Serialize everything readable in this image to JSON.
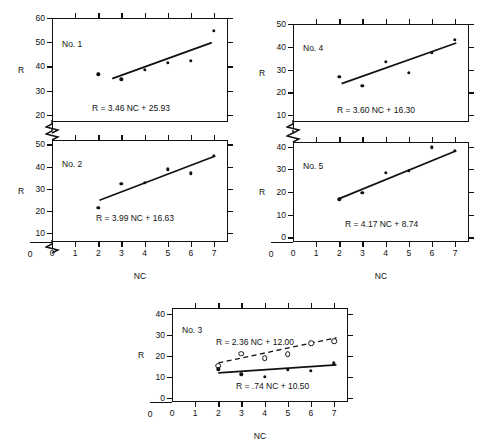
{
  "figure": {
    "axis_title_y": "R",
    "axis_title_x": "NC"
  },
  "chart_data": [
    {
      "type": "scatter",
      "title": "No. 1",
      "xlabel": "NC",
      "ylabel": "R",
      "xlim": [
        0,
        7.6
      ],
      "ylim": [
        17,
        60
      ],
      "xticks": [
        0,
        1,
        2,
        3,
        4,
        5,
        6,
        7
      ],
      "yticks": [
        20,
        30,
        40,
        50,
        60
      ],
      "grid": false,
      "series": [
        {
          "name": "observed",
          "marker": "filled-circle",
          "x": [
            2,
            3,
            4,
            5,
            6,
            7
          ],
          "y": [
            36.8,
            34.6,
            38.7,
            41.4,
            42.4,
            54.6
          ]
        }
      ],
      "fit": {
        "label": "R = 3.46 NC + 25.93",
        "slope": 3.46,
        "intercept": 25.93,
        "style": "solid",
        "x_from": 2.6,
        "x_to": 6.9
      }
    },
    {
      "type": "scatter",
      "title": "No. 4",
      "xlabel": "NC",
      "ylabel": "R",
      "xlim": [
        0,
        7.6
      ],
      "ylim": [
        7,
        50
      ],
      "xticks": [
        0,
        1,
        2,
        3,
        4,
        5,
        6,
        7
      ],
      "yticks": [
        10,
        20,
        30,
        40,
        50
      ],
      "grid": false,
      "series": [
        {
          "name": "observed",
          "marker": "filled-circle",
          "x": [
            2,
            3,
            4,
            5,
            6,
            7
          ],
          "y": [
            26.7,
            23.0,
            33.4,
            28.6,
            37.3,
            43.0
          ]
        }
      ],
      "fit": {
        "label": "R = 3.60 NC + 16.30",
        "slope": 3.6,
        "intercept": 16.3,
        "style": "solid",
        "x_from": 2.1,
        "x_to": 7.05
      }
    },
    {
      "type": "scatter",
      "title": "No. 2",
      "xlabel": "NC",
      "ylabel": "R",
      "xlim": [
        0,
        7.6
      ],
      "ylim": [
        6,
        52
      ],
      "xticks": [
        0,
        1,
        2,
        3,
        4,
        5,
        6,
        7
      ],
      "yticks": [
        10,
        20,
        30,
        40,
        50
      ],
      "grid": false,
      "series": [
        {
          "name": "observed",
          "marker": "filled-circle",
          "x": [
            2,
            3,
            4,
            5,
            6,
            7
          ],
          "y": [
            21.3,
            32.3,
            32.6,
            38.7,
            36.9,
            45.0
          ]
        }
      ],
      "fit": {
        "label": "R = 3.99 NC + 16.63",
        "slope": 3.99,
        "intercept": 16.63,
        "style": "solid",
        "x_from": 2.05,
        "x_to": 7.05
      }
    },
    {
      "type": "scatter",
      "title": "No. 5",
      "xlabel": "NC",
      "ylabel": "R",
      "xlim": [
        0,
        7.6
      ],
      "ylim": [
        -2,
        42
      ],
      "xticks": [
        0,
        1,
        2,
        3,
        4,
        5,
        6,
        7
      ],
      "yticks": [
        0,
        10,
        20,
        30,
        40
      ],
      "grid": false,
      "series": [
        {
          "name": "observed",
          "marker": "filled-circle",
          "x": [
            2,
            3,
            4,
            5,
            6,
            7
          ],
          "y": [
            16.8,
            19.6,
            28.5,
            29.4,
            39.7,
            38.0
          ]
        }
      ],
      "fit": {
        "label": "R = 4.17 NC + 8.74",
        "slope": 4.17,
        "intercept": 8.74,
        "style": "solid",
        "x_from": 2.0,
        "x_to": 7.05
      }
    },
    {
      "type": "scatter",
      "title": "No. 3",
      "xlabel": "NC",
      "ylabel": "R",
      "xlim": [
        0,
        7.6
      ],
      "ylim": [
        -2,
        43
      ],
      "xticks": [
        0,
        1,
        2,
        3,
        4,
        5,
        6,
        7
      ],
      "yticks": [
        0,
        10,
        20,
        30,
        40
      ],
      "grid": false,
      "series": [
        {
          "name": "upper-open",
          "marker": "open-circle",
          "x": [
            2,
            3,
            4,
            5,
            6,
            7
          ],
          "y": [
            15.4,
            21.2,
            19.1,
            21.0,
            26.2,
            27.2
          ]
        },
        {
          "name": "lower-filled",
          "marker": "filled-circle",
          "x": [
            2,
            3,
            4,
            5,
            6,
            7
          ],
          "y": [
            13.6,
            11.2,
            10.2,
            13.4,
            13.0,
            16.6
          ]
        }
      ],
      "fits": [
        {
          "label": "R = 2.36 NC + 12.00",
          "slope": 2.36,
          "intercept": 12.0,
          "style": "dashed",
          "x_from": 2.0,
          "x_to": 7.1
        },
        {
          "label": "R = .74 NC + 10.50",
          "slope": 0.74,
          "intercept": 10.5,
          "style": "solid",
          "x_from": 2.0,
          "x_to": 7.1
        }
      ]
    }
  ]
}
